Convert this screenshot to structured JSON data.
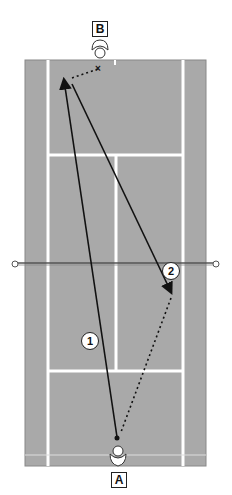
{
  "diagram": {
    "type": "tennis-court-drill",
    "court_color": "#a8a8a8",
    "line_color": "#ffffff",
    "players": [
      {
        "label": "B",
        "position": "top-baseline-center"
      },
      {
        "label": "A",
        "position": "bottom-baseline-center"
      }
    ],
    "shots": [
      {
        "number": "1",
        "style": "solid-arrow",
        "from": "A",
        "to": "top-left-deep"
      },
      {
        "number": "2",
        "style": "solid-arrow",
        "from": "top-left-deep",
        "to": "bottom-right-service-box"
      }
    ],
    "movements": [
      {
        "style": "dotted",
        "from": "B",
        "to": "top-left-deep",
        "marker": "x"
      },
      {
        "style": "dotted",
        "from": "bottom-right-service-box",
        "to": "A"
      }
    ]
  }
}
